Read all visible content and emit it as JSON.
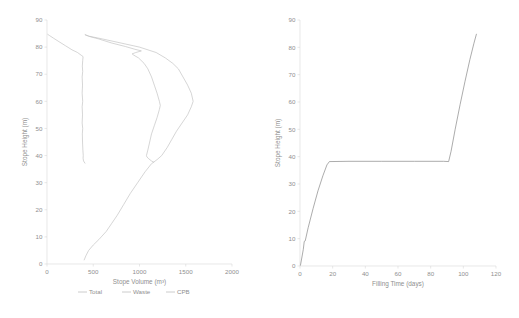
{
  "chart_data": [
    {
      "id": "stope-volume-profile",
      "type": "line",
      "title": "",
      "xlabel": "Stope Volume (m³)",
      "ylabel": "Stope Height (m)",
      "xlim": [
        0,
        2000
      ],
      "ylim": [
        0,
        90
      ],
      "xticks": [
        0,
        500,
        1000,
        1500,
        2000
      ],
      "yticks": [
        0,
        10,
        20,
        30,
        40,
        50,
        60,
        70,
        80,
        90
      ],
      "grid": false,
      "legend_position": "bottom",
      "orientation": "x=volume, y=height",
      "series": [
        {
          "name": "Total",
          "color": "#bfbfbf",
          "points": [
            [
              402,
              1.5
            ],
            [
              420,
              3
            ],
            [
              450,
              5
            ],
            [
              500,
              7
            ],
            [
              560,
              9
            ],
            [
              640,
              12
            ],
            [
              700,
              15
            ],
            [
              760,
              18
            ],
            [
              830,
              22
            ],
            [
              900,
              26
            ],
            [
              980,
              30
            ],
            [
              1060,
              34
            ],
            [
              1130,
              37
            ],
            [
              1190,
              38.5
            ],
            [
              1240,
              40
            ],
            [
              1300,
              43
            ],
            [
              1350,
              46
            ],
            [
              1400,
              49
            ],
            [
              1460,
              52
            ],
            [
              1520,
              55
            ],
            [
              1560,
              58
            ],
            [
              1580,
              60
            ],
            [
              1560,
              63
            ],
            [
              1520,
              66
            ],
            [
              1470,
              69
            ],
            [
              1420,
              72
            ],
            [
              1360,
              74
            ],
            [
              1280,
              76
            ],
            [
              1180,
              78
            ],
            [
              1000,
              80
            ],
            [
              800,
              81.5
            ],
            [
              600,
              83
            ],
            [
              460,
              84
            ],
            [
              415,
              84.5
            ]
          ]
        },
        {
          "name": "Waste",
          "color": "#bfbfbf",
          "points": [
            [
              1155,
              37.5
            ],
            [
              1130,
              38
            ],
            [
              1100,
              38.8
            ],
            [
              1080,
              39.5
            ],
            [
              1075,
              40
            ],
            [
              1090,
              42
            ],
            [
              1110,
              45
            ],
            [
              1130,
              48
            ],
            [
              1160,
              51
            ],
            [
              1190,
              54
            ],
            [
              1215,
              57
            ],
            [
              1225,
              58.5
            ],
            [
              1215,
              60
            ],
            [
              1190,
              63
            ],
            [
              1160,
              66
            ],
            [
              1130,
              69
            ],
            [
              1090,
              72
            ],
            [
              1050,
              74
            ],
            [
              990,
              76
            ],
            [
              940,
              77
            ],
            [
              920,
              77.5
            ],
            [
              960,
              78
            ],
            [
              1020,
              78.6
            ],
            [
              950,
              79.2
            ],
            [
              850,
              80.2
            ],
            [
              700,
              81.5
            ],
            [
              560,
              83
            ],
            [
              450,
              84
            ],
            [
              412,
              84.6
            ]
          ]
        },
        {
          "name": "CPB",
          "color": "#bfbfbf",
          "points": [
            [
              410,
              37.2
            ],
            [
              395,
              38
            ],
            [
              390,
              39
            ],
            [
              392,
              40
            ],
            [
              388,
              42
            ],
            [
              384,
              45
            ],
            [
              382,
              48
            ],
            [
              386,
              50
            ],
            [
              380,
              52
            ],
            [
              384,
              55
            ],
            [
              380,
              58
            ],
            [
              386,
              60
            ],
            [
              380,
              63
            ],
            [
              384,
              66
            ],
            [
              380,
              69
            ],
            [
              386,
              71
            ],
            [
              382,
              73
            ],
            [
              386,
              75
            ],
            [
              390,
              76.5
            ],
            [
              370,
              77
            ],
            [
              330,
              78
            ],
            [
              270,
              79
            ],
            [
              200,
              80.5
            ],
            [
              130,
              82
            ],
            [
              70,
              83.3
            ],
            [
              30,
              84.2
            ],
            [
              8,
              84.7
            ]
          ]
        }
      ],
      "legend": [
        {
          "label": "Total",
          "color": "#bfbfbf"
        },
        {
          "label": "Waste",
          "color": "#bfbfbf"
        },
        {
          "label": "CPB",
          "color": "#bfbfbf"
        }
      ]
    },
    {
      "id": "filling-time-profile",
      "type": "line",
      "title": "",
      "xlabel": "Filling Time (days)",
      "ylabel": "Stope Height (m)",
      "xlim": [
        0,
        120
      ],
      "ylim": [
        0,
        90
      ],
      "xticks": [
        0,
        20,
        40,
        60,
        80,
        100,
        120
      ],
      "yticks": [
        0,
        10,
        20,
        30,
        40,
        50,
        60,
        70,
        80,
        90
      ],
      "grid": false,
      "legend_position": "none",
      "series": [
        {
          "name": "Filling schedule",
          "color": "#7f7f7f",
          "points": [
            [
              0.3,
              0.3
            ],
            [
              2.0,
              6.0
            ],
            [
              2.6,
              9.0
            ],
            [
              3.2,
              9.2
            ],
            [
              5.0,
              14.0
            ],
            [
              8.0,
              21.0
            ],
            [
              11.0,
              27.5
            ],
            [
              14.0,
              33.0
            ],
            [
              16.5,
              37.0
            ],
            [
              18.0,
              38.2
            ],
            [
              30.0,
              38.3
            ],
            [
              50.0,
              38.3
            ],
            [
              70.0,
              38.3
            ],
            [
              88.0,
              38.3
            ],
            [
              91.0,
              38.2
            ],
            [
              92.5,
              42.0
            ],
            [
              95.0,
              50.0
            ],
            [
              98.0,
              59.0
            ],
            [
              101.0,
              67.5
            ],
            [
              104.0,
              75.5
            ],
            [
              106.5,
              81.5
            ],
            [
              108.0,
              84.8
            ]
          ]
        }
      ],
      "legend": []
    }
  ],
  "left_chart": {
    "xlabel": "Stope Volume (m³)",
    "ylabel": "Stope Height (m)",
    "xticks": [
      "0",
      "500",
      "1000",
      "1500",
      "2000"
    ],
    "yticks": [
      "0",
      "10",
      "20",
      "30",
      "40",
      "50",
      "60",
      "70",
      "80",
      "90"
    ],
    "legend": [
      "Total",
      "Waste",
      "CPB"
    ]
  },
  "right_chart": {
    "xlabel": "Filling Time (days)",
    "ylabel": "Stope Height (m)",
    "xticks": [
      "0",
      "20",
      "40",
      "60",
      "80",
      "100",
      "120"
    ],
    "yticks": [
      "0",
      "10",
      "20",
      "30",
      "40",
      "50",
      "60",
      "70",
      "80",
      "90"
    ]
  },
  "colors": {
    "axis": "#d9d9d9",
    "text": "#8f8f8f",
    "series_light": "#bfbfbf",
    "series_dark": "#7f7f7f",
    "background": "#ffffff"
  }
}
